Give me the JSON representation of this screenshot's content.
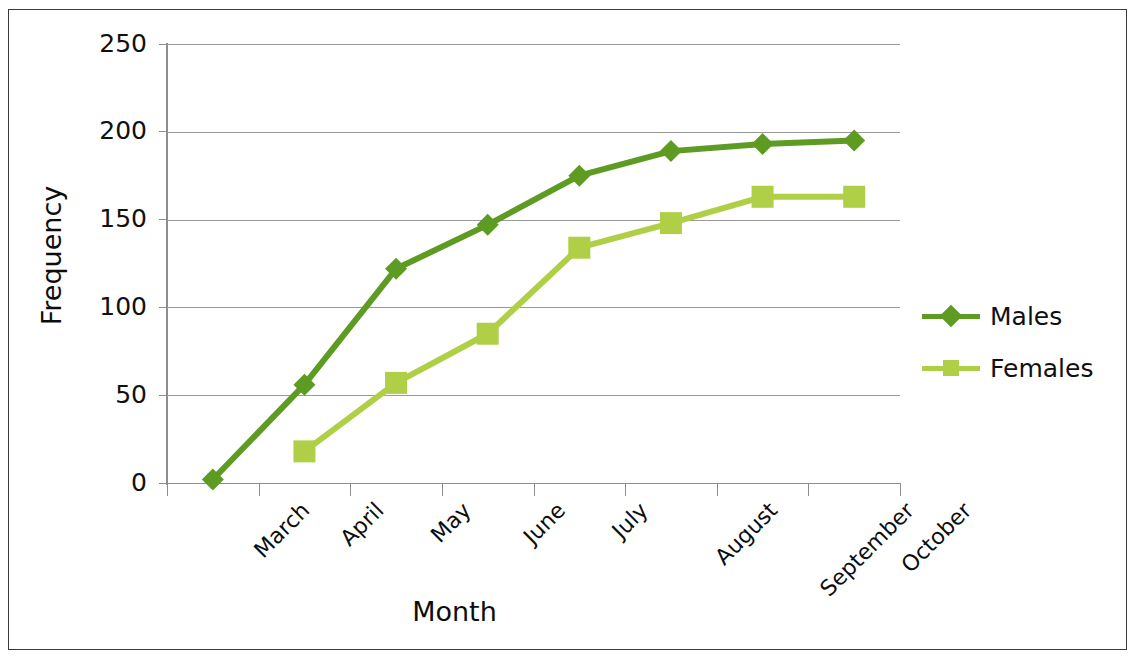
{
  "chart_data": {
    "type": "line",
    "title": "",
    "xlabel": "Month",
    "ylabel": "Frequency",
    "categories": [
      "March",
      "April",
      "May",
      "June",
      "July",
      "August",
      "September",
      "October"
    ],
    "series": [
      {
        "name": "Males",
        "color": "#5E9B23",
        "marker": "diamond",
        "values": [
          2,
          56,
          122,
          147,
          175,
          189,
          193,
          195
        ]
      },
      {
        "name": "Females",
        "color": "#AFD046",
        "marker": "square",
        "values": [
          null,
          18,
          57,
          85,
          134,
          148,
          163,
          163
        ]
      }
    ],
    "ylim": [
      0,
      250
    ],
    "yticks": [
      0,
      50,
      100,
      150,
      200,
      250
    ],
    "ytick_labels": [
      "0",
      "50",
      "100",
      "150",
      "200",
      "250"
    ],
    "grid": "horizontal",
    "legend_position": "right",
    "legend_entries": [
      "Males",
      "Females"
    ],
    "axis_color": "#8d8d8d",
    "gridline_color": "#9a9a9a",
    "frame_color": "#3a3a3a",
    "background": "#ffffff"
  }
}
